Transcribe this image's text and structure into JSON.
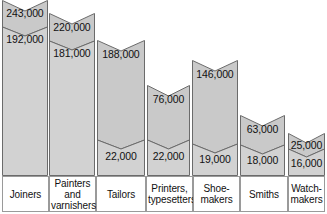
{
  "chart_data": {
    "type": "bar",
    "title": "",
    "subtitle": "",
    "xlabel": "",
    "ylabel": "",
    "grid": false,
    "legend_position": "none",
    "ylim": [
      0,
      243000
    ],
    "categories": [
      "Joiners",
      "Painters and varnishers",
      "Tailors",
      "Printers, typesetters",
      "Shoemakers",
      "Smiths",
      "Watchmakers"
    ],
    "series": [
      {
        "name": "upper",
        "values": [
          243000,
          220000,
          188000,
          76000,
          146000,
          63000,
          25000
        ]
      },
      {
        "name": "lower",
        "values": [
          192000,
          181000,
          22000,
          22000,
          19000,
          18000,
          16000
        ]
      }
    ],
    "annotations": [
      "243,000",
      "192,000",
      "220,000",
      "181,000",
      "188,000",
      "22,000",
      "76,000",
      "22,000",
      "146,000",
      "19,000",
      "63,000",
      "18,000",
      "25,000",
      "16,000"
    ]
  },
  "colors": {
    "bar_fill": "#c9c9c9",
    "bar_fill_light": "#d2d2d2",
    "bar_stroke": "#6b6b6b",
    "divider_stroke": "#6b6b6b",
    "table_border": "#9a9a9a",
    "text": "#111111",
    "background": "#ffffff"
  },
  "bars": [
    {
      "key": "joiners",
      "label": "Joiners",
      "label_lines": [
        "Joiners"
      ],
      "upper_value": "243,000",
      "lower_value": "192,000",
      "x": 2,
      "width": 46,
      "top": 0,
      "notch_depth": 11,
      "divider_y": 27,
      "divider_depth": 9,
      "upper_label_y": 8,
      "lower_label_y": 34
    },
    {
      "key": "painters-and-varnishers",
      "label": "Painters and varnishers",
      "label_lines": [
        "Painters",
        "and",
        "varnishers"
      ],
      "upper_value": "220,000",
      "lower_value": "181,000",
      "x": 49,
      "width": 46,
      "top": 13,
      "notch_depth": 11,
      "divider_y": 41,
      "divider_depth": 9,
      "upper_label_y": 22,
      "lower_label_y": 48
    },
    {
      "key": "tailors",
      "label": "Tailors",
      "label_lines": [
        "Tailors"
      ],
      "upper_value": "188,000",
      "lower_value": "22,000",
      "x": 97,
      "width": 48,
      "top": 40,
      "notch_depth": 11,
      "divider_y": 140,
      "divider_depth": 9,
      "upper_label_y": 49,
      "lower_label_y": 151
    },
    {
      "key": "printers-typesetters",
      "label": "Printers, typesetters",
      "label_lines": [
        "Printers,",
        "typesetters"
      ],
      "upper_value": "76,000",
      "lower_value": "22,000",
      "x": 147,
      "width": 43,
      "top": 85,
      "notch_depth": 11,
      "divider_y": 140,
      "divider_depth": 9,
      "upper_label_y": 94,
      "lower_label_y": 151
    },
    {
      "key": "shoemakers",
      "label": "Shoemakers",
      "label_lines": [
        "Shoe-",
        "makers"
      ],
      "upper_value": "146,000",
      "lower_value": "19,000",
      "x": 192,
      "width": 46,
      "top": 60,
      "notch_depth": 11,
      "divider_y": 144,
      "divider_depth": 9,
      "upper_label_y": 69,
      "lower_label_y": 154
    },
    {
      "key": "smiths",
      "label": "Smiths",
      "label_lines": [
        "Smiths"
      ],
      "upper_value": "63,000",
      "lower_value": "18,000",
      "x": 240,
      "width": 45,
      "top": 115,
      "notch_depth": 11,
      "divider_y": 145,
      "divider_depth": 9,
      "upper_label_y": 124,
      "lower_label_y": 155
    },
    {
      "key": "watchmakers",
      "label": "Watchmakers",
      "label_lines": [
        "Watch-",
        "makers"
      ],
      "upper_value": "25,000",
      "lower_value": "16,000",
      "x": 288,
      "width": 37,
      "top": 133,
      "notch_depth": 10,
      "divider_y": 149,
      "divider_depth": 8,
      "upper_label_y": 140,
      "lower_label_y": 158
    }
  ],
  "label_cells": [
    {
      "key": "joiners",
      "x": 2,
      "width": 47,
      "lines": [
        "Joiners"
      ]
    },
    {
      "key": "painters-and-varnishers",
      "x": 49,
      "width": 47,
      "lines": [
        "Painters",
        "and",
        "varnishers"
      ]
    },
    {
      "key": "tailors",
      "x": 96,
      "width": 50,
      "lines": [
        "Tailors"
      ]
    },
    {
      "key": "printers-typesetters",
      "x": 146,
      "width": 47,
      "lines": [
        "Printers,",
        "typesetters"
      ]
    },
    {
      "key": "shoemakers",
      "x": 193,
      "width": 47,
      "lines": [
        "Shoe-",
        "makers"
      ]
    },
    {
      "key": "smiths",
      "x": 240,
      "width": 48,
      "lines": [
        "Smiths"
      ]
    },
    {
      "key": "watchmakers",
      "x": 288,
      "width": 37,
      "lines": [
        "Watch-",
        "makers"
      ]
    }
  ]
}
